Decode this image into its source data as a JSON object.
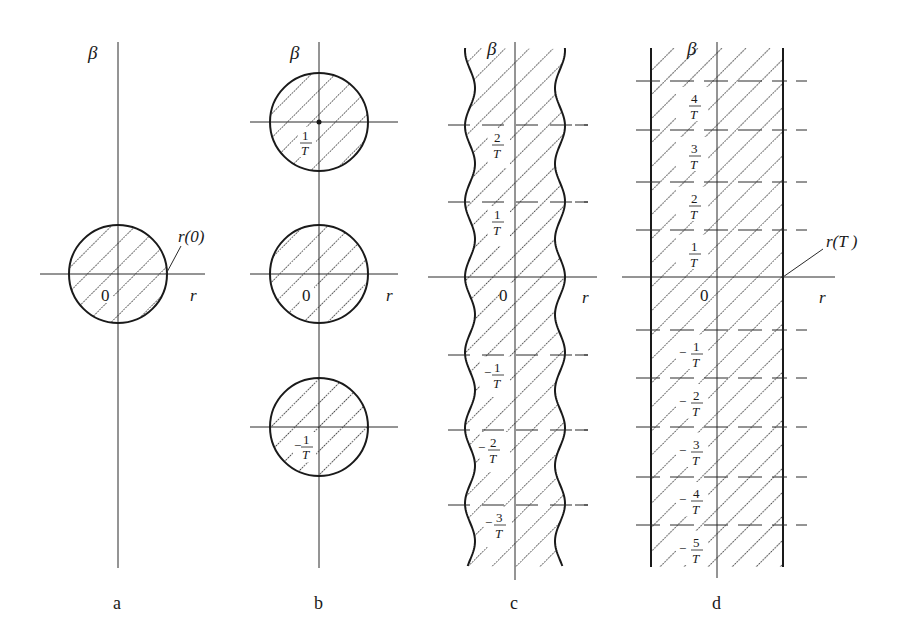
{
  "figure": {
    "axis_labels": {
      "vertical": "β",
      "horizontal": "r",
      "origin": "0"
    },
    "panels": [
      {
        "id": "a",
        "label": "a",
        "shape": "circle",
        "annotation": "r(0)",
        "frequency_labels": []
      },
      {
        "id": "b",
        "label": "b",
        "shape": "three circles",
        "frequency_labels": [
          {
            "sign": "",
            "num": "1",
            "den": "T"
          },
          {
            "sign": "",
            "num": "0",
            "den": ""
          },
          {
            "sign": "−",
            "num": "1",
            "den": "T"
          }
        ]
      },
      {
        "id": "c",
        "label": "c",
        "shape": "wavy band",
        "frequency_labels": [
          {
            "sign": "",
            "num": "2",
            "den": "T"
          },
          {
            "sign": "",
            "num": "1",
            "den": "T"
          },
          {
            "sign": "−",
            "num": "1",
            "den": "T"
          },
          {
            "sign": "−",
            "num": "2",
            "den": "T"
          },
          {
            "sign": "−",
            "num": "3",
            "den": "T"
          }
        ]
      },
      {
        "id": "d",
        "label": "d",
        "shape": "straight band",
        "annotation": "r(T )",
        "frequency_labels": [
          {
            "sign": "",
            "num": "4",
            "den": "T"
          },
          {
            "sign": "",
            "num": "3",
            "den": "T"
          },
          {
            "sign": "",
            "num": "2",
            "den": "T"
          },
          {
            "sign": "",
            "num": "1",
            "den": "T"
          },
          {
            "sign": "−",
            "num": "1",
            "den": "T"
          },
          {
            "sign": "−",
            "num": "2",
            "den": "T"
          },
          {
            "sign": "−",
            "num": "3",
            "den": "T"
          },
          {
            "sign": "−",
            "num": "4",
            "den": "T"
          },
          {
            "sign": "−",
            "num": "5",
            "den": "T"
          }
        ]
      }
    ]
  }
}
